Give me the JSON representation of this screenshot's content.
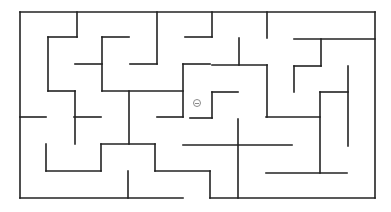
{
  "game": {
    "type": "maze",
    "background_color": "#ffffff",
    "wall_color": "#222222",
    "marker": {
      "name": "player-token",
      "glyph": "⊖",
      "x": 197,
      "y": 103,
      "color": "#8a8a8a"
    },
    "walls": [
      [
        20,
        12,
        375,
        12
      ],
      [
        20,
        12,
        20,
        198
      ],
      [
        375,
        12,
        375,
        198
      ],
      [
        20,
        198,
        183,
        198
      ],
      [
        210,
        198,
        375,
        198
      ],
      [
        77,
        12,
        77,
        37
      ],
      [
        48,
        37,
        77,
        37
      ],
      [
        48,
        37,
        48,
        91
      ],
      [
        48,
        91,
        75,
        91
      ],
      [
        75,
        91,
        75,
        144
      ],
      [
        75,
        64,
        102,
        64
      ],
      [
        102,
        37,
        102,
        91
      ],
      [
        102,
        37,
        129,
        37
      ],
      [
        157,
        12,
        157,
        64
      ],
      [
        130,
        64,
        157,
        64
      ],
      [
        102,
        91,
        183,
        91
      ],
      [
        129,
        91,
        129,
        144
      ],
      [
        183,
        64,
        183,
        117
      ],
      [
        183,
        64,
        210,
        64
      ],
      [
        185,
        37,
        212,
        37
      ],
      [
        212,
        12,
        212,
        37
      ],
      [
        267,
        12,
        267,
        38
      ],
      [
        239,
        38,
        239,
        65
      ],
      [
        212,
        65,
        267,
        65
      ],
      [
        267,
        65,
        267,
        117
      ],
      [
        294,
        39,
        375,
        39
      ],
      [
        321,
        39,
        321,
        66
      ],
      [
        294,
        66,
        321,
        66
      ],
      [
        294,
        66,
        294,
        92
      ],
      [
        348,
        66,
        348,
        146
      ],
      [
        320,
        92,
        348,
        92
      ],
      [
        320,
        92,
        320,
        173
      ],
      [
        266,
        117,
        320,
        117
      ],
      [
        157,
        117,
        183,
        117
      ],
      [
        20,
        117,
        46,
        117
      ],
      [
        74,
        117,
        101,
        117
      ],
      [
        101,
        144,
        155,
        144
      ],
      [
        101,
        144,
        101,
        171
      ],
      [
        46,
        144,
        46,
        171
      ],
      [
        46,
        171,
        101,
        171
      ],
      [
        155,
        144,
        155,
        171
      ],
      [
        155,
        171,
        210,
        171
      ],
      [
        210,
        171,
        210,
        198
      ],
      [
        128,
        171,
        128,
        198
      ],
      [
        212,
        92,
        238,
        92
      ],
      [
        212,
        92,
        212,
        118
      ],
      [
        190,
        118,
        212,
        118
      ],
      [
        183,
        145,
        292,
        145
      ],
      [
        238,
        119,
        238,
        198
      ],
      [
        266,
        173,
        347,
        173
      ]
    ]
  }
}
